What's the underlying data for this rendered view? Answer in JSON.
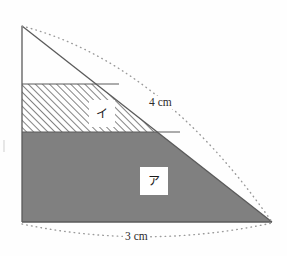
{
  "figure": {
    "background_color": "#fefefe",
    "outline_color": "#5a5a5a",
    "gray_fill_color": "#808080",
    "hatch_color": "#6e6e6e",
    "dotted_arc_color": "#9a9a9a",
    "triangle": {
      "apex": [
        22,
        26
      ],
      "bottom_left": [
        22,
        222
      ],
      "bottom_right": [
        272,
        222
      ]
    },
    "bands": {
      "hatched_band": {
        "label": "イ",
        "top_y": 84,
        "bottom_y": 132,
        "fill": "diagonal-hatch"
      },
      "gray_band": {
        "label": "ア",
        "top_y": 132,
        "bottom_y": 222,
        "fill": "solid-gray"
      }
    },
    "dimensions": {
      "hypotenuse_label": "4 cm",
      "base_label": "3 cm"
    },
    "labels": {
      "region_a": "ア",
      "region_i": "イ"
    }
  }
}
